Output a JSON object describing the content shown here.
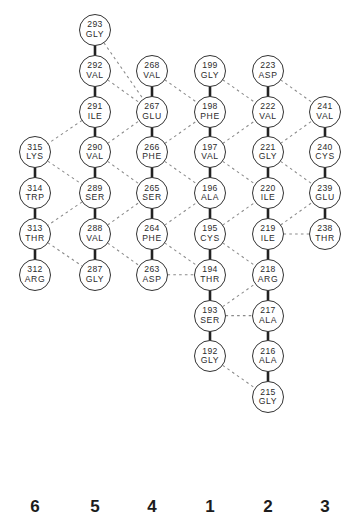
{
  "diagram": {
    "geometry": {
      "columns_x": [
        35,
        95,
        152,
        210,
        268,
        325
      ],
      "row_step": 40.8,
      "row0_y": 30,
      "radius": 16
    },
    "colors": {
      "circle_stroke": "#333333",
      "covalent_bond": "#222222",
      "hydrogen_bond": "#8a8a8a",
      "text": "#2b2b2b",
      "background": "#ffffff"
    },
    "strand_labels": [
      {
        "label": "6",
        "col": 0
      },
      {
        "label": "5",
        "col": 1
      },
      {
        "label": "4",
        "col": 2
      },
      {
        "label": "1",
        "col": 3
      },
      {
        "label": "2",
        "col": 4
      },
      {
        "label": "3",
        "col": 5
      }
    ],
    "strand_label_y": 497,
    "residues": [
      {
        "id": "r293",
        "num": "293",
        "aa": "GLY",
        "col": 1,
        "row": 0
      },
      {
        "id": "r292",
        "num": "292",
        "aa": "VAL",
        "col": 1,
        "row": 1
      },
      {
        "id": "r291",
        "num": "291",
        "aa": "ILE",
        "col": 1,
        "row": 2
      },
      {
        "id": "r290",
        "num": "290",
        "aa": "VAL",
        "col": 1,
        "row": 3
      },
      {
        "id": "r289",
        "num": "289",
        "aa": "SER",
        "col": 1,
        "row": 4
      },
      {
        "id": "r288",
        "num": "288",
        "aa": "VAL",
        "col": 1,
        "row": 5
      },
      {
        "id": "r287",
        "num": "287",
        "aa": "GLY",
        "col": 1,
        "row": 6
      },
      {
        "id": "r315",
        "num": "315",
        "aa": "LYS",
        "col": 0,
        "row": 3
      },
      {
        "id": "r314",
        "num": "314",
        "aa": "TRP",
        "col": 0,
        "row": 4
      },
      {
        "id": "r313",
        "num": "313",
        "aa": "THR",
        "col": 0,
        "row": 5
      },
      {
        "id": "r312",
        "num": "312",
        "aa": "ARG",
        "col": 0,
        "row": 6
      },
      {
        "id": "r268",
        "num": "268",
        "aa": "VAL",
        "col": 2,
        "row": 1
      },
      {
        "id": "r267",
        "num": "267",
        "aa": "GLU",
        "col": 2,
        "row": 2
      },
      {
        "id": "r266",
        "num": "266",
        "aa": "PHE",
        "col": 2,
        "row": 3
      },
      {
        "id": "r265",
        "num": "265",
        "aa": "SER",
        "col": 2,
        "row": 4
      },
      {
        "id": "r264",
        "num": "264",
        "aa": "PHE",
        "col": 2,
        "row": 5
      },
      {
        "id": "r263",
        "num": "263",
        "aa": "ASP",
        "col": 2,
        "row": 6
      },
      {
        "id": "r199",
        "num": "199",
        "aa": "GLY",
        "col": 3,
        "row": 1
      },
      {
        "id": "r198",
        "num": "198",
        "aa": "PHE",
        "col": 3,
        "row": 2
      },
      {
        "id": "r197",
        "num": "197",
        "aa": "VAL",
        "col": 3,
        "row": 3
      },
      {
        "id": "r196",
        "num": "196",
        "aa": "ALA",
        "col": 3,
        "row": 4
      },
      {
        "id": "r195",
        "num": "195",
        "aa": "CYS",
        "col": 3,
        "row": 5
      },
      {
        "id": "r194",
        "num": "194",
        "aa": "THR",
        "col": 3,
        "row": 6
      },
      {
        "id": "r193",
        "num": "193",
        "aa": "SER",
        "col": 3,
        "row": 7
      },
      {
        "id": "r192",
        "num": "192",
        "aa": "GLY",
        "col": 3,
        "row": 8
      },
      {
        "id": "r223",
        "num": "223",
        "aa": "ASP",
        "col": 4,
        "row": 1
      },
      {
        "id": "r222",
        "num": "222",
        "aa": "VAL",
        "col": 4,
        "row": 2
      },
      {
        "id": "r221",
        "num": "221",
        "aa": "GLY",
        "col": 4,
        "row": 3
      },
      {
        "id": "r220",
        "num": "220",
        "aa": "ILE",
        "col": 4,
        "row": 4
      },
      {
        "id": "r219",
        "num": "219",
        "aa": "ILE",
        "col": 4,
        "row": 5
      },
      {
        "id": "r218",
        "num": "218",
        "aa": "ARG",
        "col": 4,
        "row": 6
      },
      {
        "id": "r217",
        "num": "217",
        "aa": "ALA",
        "col": 4,
        "row": 7
      },
      {
        "id": "r216",
        "num": "216",
        "aa": "ALA",
        "col": 4,
        "row": 8
      },
      {
        "id": "r215",
        "num": "215",
        "aa": "GLY",
        "col": 4,
        "row": 9
      },
      {
        "id": "r241",
        "num": "241",
        "aa": "VAL",
        "col": 5,
        "row": 2
      },
      {
        "id": "r240",
        "num": "240",
        "aa": "CYS",
        "col": 5,
        "row": 3
      },
      {
        "id": "r239",
        "num": "239",
        "aa": "GLU",
        "col": 5,
        "row": 4
      },
      {
        "id": "r238",
        "num": "238",
        "aa": "THR",
        "col": 5,
        "row": 5
      }
    ],
    "covalent_bonds": [
      [
        "r293",
        "r292"
      ],
      [
        "r292",
        "r291"
      ],
      [
        "r291",
        "r290"
      ],
      [
        "r290",
        "r289"
      ],
      [
        "r289",
        "r288"
      ],
      [
        "r288",
        "r287"
      ],
      [
        "r315",
        "r314"
      ],
      [
        "r314",
        "r313"
      ],
      [
        "r313",
        "r312"
      ],
      [
        "r268",
        "r267"
      ],
      [
        "r267",
        "r266"
      ],
      [
        "r266",
        "r265"
      ],
      [
        "r265",
        "r264"
      ],
      [
        "r264",
        "r263"
      ],
      [
        "r199",
        "r198"
      ],
      [
        "r198",
        "r197"
      ],
      [
        "r197",
        "r196"
      ],
      [
        "r196",
        "r195"
      ],
      [
        "r195",
        "r194"
      ],
      [
        "r194",
        "r193"
      ],
      [
        "r193",
        "r192"
      ],
      [
        "r223",
        "r222"
      ],
      [
        "r222",
        "r221"
      ],
      [
        "r221",
        "r220"
      ],
      [
        "r220",
        "r219"
      ],
      [
        "r219",
        "r218"
      ],
      [
        "r218",
        "r217"
      ],
      [
        "r217",
        "r216"
      ],
      [
        "r216",
        "r215"
      ],
      [
        "r241",
        "r240"
      ],
      [
        "r240",
        "r239"
      ],
      [
        "r239",
        "r238"
      ]
    ],
    "hydrogen_bonds": [
      [
        "r293",
        "r267"
      ],
      [
        "r292",
        "r267"
      ],
      [
        "r291",
        "r315"
      ],
      [
        "r315",
        "r289"
      ],
      [
        "r290",
        "r267"
      ],
      [
        "r290",
        "r265"
      ],
      [
        "r289",
        "r313"
      ],
      [
        "r313",
        "r287"
      ],
      [
        "r288",
        "r265"
      ],
      [
        "r288",
        "r263"
      ],
      [
        "r268",
        "r198"
      ],
      [
        "r266",
        "r198"
      ],
      [
        "r266",
        "r196"
      ],
      [
        "r264",
        "r196"
      ],
      [
        "r264",
        "r194"
      ],
      [
        "r263",
        "r194"
      ],
      [
        "r199",
        "r222"
      ],
      [
        "r197",
        "r222"
      ],
      [
        "r197",
        "r220"
      ],
      [
        "r195",
        "r220"
      ],
      [
        "r195",
        "r218"
      ],
      [
        "r193",
        "r218"
      ],
      [
        "r193",
        "r217"
      ],
      [
        "r192",
        "r215"
      ],
      [
        "r223",
        "r241"
      ],
      [
        "r221",
        "r241"
      ],
      [
        "r221",
        "r239"
      ],
      [
        "r219",
        "r239"
      ],
      [
        "r219",
        "r238"
      ]
    ]
  }
}
